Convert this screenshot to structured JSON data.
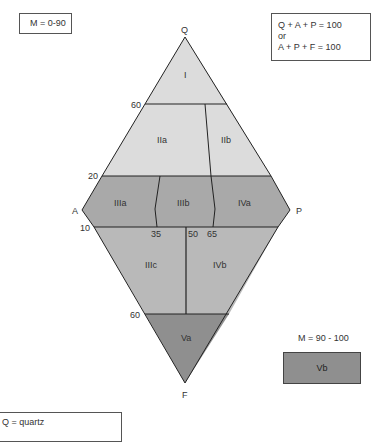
{
  "header": {
    "m_range_label": "M = 0-90",
    "equations": [
      "Q + A + P = 100",
      "or",
      "A + P + F = 100"
    ]
  },
  "diagram": {
    "apices": {
      "top": "Q",
      "left": "A",
      "right": "P",
      "bottom": "F"
    },
    "tick_labels": {
      "q60": "60",
      "q20": "20",
      "f10": "10",
      "f60": "60",
      "p35": "35",
      "p50": "50",
      "p65": "65"
    },
    "fields": {
      "I": "I",
      "IIa": "IIa",
      "IIb": "IIb",
      "IIIa": "IIIa",
      "IIIb": "IIIb",
      "IVa": "IVa",
      "IIIc": "IIIc",
      "IVb": "IVb",
      "Va": "Va"
    },
    "colors": {
      "light": "#dcdcdc",
      "medium": "#a9a9a9",
      "mid_light": "#b9b9b9",
      "dark": "#8f8f8f",
      "line": "#222222"
    }
  },
  "side_panel": {
    "m_range_label": "M = 90 - 100",
    "field_label": "Vb"
  },
  "legend": {
    "items": [
      "Q = quartz"
    ]
  }
}
